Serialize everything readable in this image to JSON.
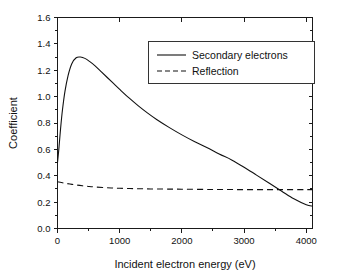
{
  "chart_data": {
    "type": "line",
    "title": "",
    "xlabel": "Incident electron energy (eV)",
    "ylabel": "Coefficient",
    "xlim": [
      0,
      4100
    ],
    "ylim": [
      0.0,
      1.6
    ],
    "grid": false,
    "legend_position": "upper-right",
    "xticks": [
      0,
      1000,
      2000,
      3000,
      4000
    ],
    "xtick_labels": [
      "0",
      "1000",
      "2000",
      "3000",
      "4000"
    ],
    "xminor_step": 500,
    "yticks": [
      0.0,
      0.2,
      0.4,
      0.6,
      0.8,
      1.0,
      1.2,
      1.4,
      1.6
    ],
    "ytick_labels": [
      "0.0",
      "0.2",
      "0.4",
      "0.6",
      "0.8",
      "1.0",
      "1.2",
      "1.4",
      "1.6"
    ],
    "yminor_step": 0.1,
    "series": [
      {
        "name": "Secondary electrons",
        "style": "solid",
        "color": "#111111",
        "x": [
          0,
          25,
          50,
          80,
          120,
          170,
          230,
          300,
          370,
          440,
          520,
          600,
          700,
          800,
          900,
          1000,
          1150,
          1300,
          1450,
          1600,
          1800,
          2000,
          2200,
          2400,
          2600,
          2800,
          3000,
          3200,
          3400,
          3600,
          3800,
          4000,
          4100
        ],
        "y": [
          0.5,
          0.62,
          0.76,
          0.9,
          1.04,
          1.16,
          1.25,
          1.295,
          1.3,
          1.29,
          1.265,
          1.235,
          1.19,
          1.145,
          1.1,
          1.055,
          0.99,
          0.93,
          0.875,
          0.825,
          0.765,
          0.71,
          0.66,
          0.615,
          0.565,
          0.52,
          0.465,
          0.405,
          0.345,
          0.285,
          0.225,
          0.18,
          0.17
        ]
      },
      {
        "name": "Reflection",
        "style": "dashed",
        "color": "#111111",
        "x": [
          0,
          100,
          200,
          300,
          400,
          500,
          600,
          800,
          1000,
          1250,
          1500,
          1750,
          2000,
          2500,
          3000,
          3500,
          4000,
          4100
        ],
        "y": [
          0.355,
          0.345,
          0.337,
          0.33,
          0.324,
          0.319,
          0.315,
          0.309,
          0.305,
          0.302,
          0.3,
          0.299,
          0.298,
          0.296,
          0.295,
          0.295,
          0.295,
          0.295
        ]
      }
    ],
    "annotations": []
  },
  "legend": {
    "entries": [
      {
        "label": "Secondary electrons",
        "style": "solid"
      },
      {
        "label": "Reflection",
        "style": "dashed"
      }
    ]
  },
  "colors": {
    "background": "#ffffff",
    "axis": "#1a1a1a",
    "text": "#111111",
    "line": "#111111"
  }
}
